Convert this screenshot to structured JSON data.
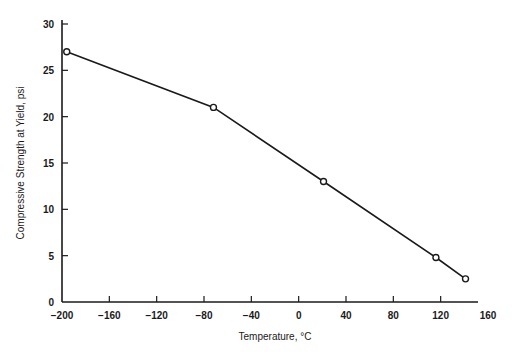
{
  "chart_data": {
    "type": "line",
    "title": "",
    "xlabel": "Temperature, °C",
    "ylabel": "Compressive Strength at Yield, psi",
    "xlim": [
      -200,
      160
    ],
    "ylim": [
      0,
      30
    ],
    "x_ticks": [
      -200,
      -160,
      -120,
      -80,
      -40,
      0,
      40,
      80,
      120,
      160
    ],
    "x_tick_labels": [
      "−200",
      "−160",
      "−120",
      "−80",
      "−40",
      "0",
      "40",
      "80",
      "120",
      "160"
    ],
    "y_ticks": [
      0,
      5,
      10,
      15,
      20,
      25,
      30
    ],
    "y_tick_labels": [
      "0",
      "5",
      "10",
      "15",
      "20",
      "25",
      "30"
    ],
    "grid": false,
    "legend": null,
    "series": [
      {
        "name": "Compressive strength",
        "marker": "open-circle",
        "color": "#1a1a1a",
        "x": [
          -196,
          -72,
          21,
          116,
          141
        ],
        "y": [
          27.0,
          21.0,
          13.0,
          4.8,
          2.5
        ]
      }
    ]
  }
}
